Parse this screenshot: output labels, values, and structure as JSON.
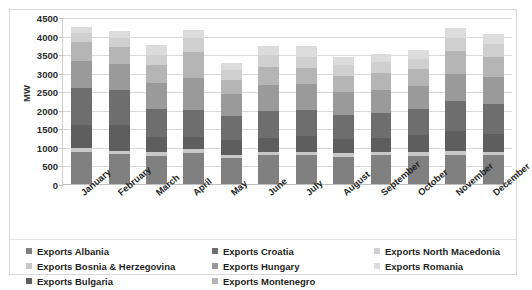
{
  "chart_data": {
    "type": "bar",
    "stacked": true,
    "title": "",
    "xlabel": "",
    "ylabel": "MW",
    "ylim": [
      0,
      4500
    ],
    "ytick_step": 500,
    "yticks": [
      0,
      500,
      1000,
      1500,
      2000,
      2500,
      3000,
      3500,
      4000,
      4500
    ],
    "grid": true,
    "legend_position": "bottom",
    "categories": [
      "January",
      "February",
      "March",
      "April",
      "May",
      "June",
      "July",
      "August",
      "September",
      "October",
      "November",
      "December"
    ],
    "series": [
      {
        "name": "Exports Albania",
        "color": "#808080",
        "values": [
          900,
          830,
          790,
          860,
          730,
          800,
          800,
          760,
          800,
          790,
          820,
          800
        ]
      },
      {
        "name": "Exports Bosnia & Herzegovina",
        "color": "#c8c8c8",
        "values": [
          110,
          100,
          95,
          105,
          90,
          100,
          100,
          95,
          100,
          100,
          105,
          100
        ]
      },
      {
        "name": "Exports Bulgaria",
        "color": "#5e5e5e",
        "values": [
          600,
          700,
          400,
          320,
          400,
          380,
          420,
          380,
          380,
          450,
          520,
          480
        ]
      },
      {
        "name": "Exports Croatia",
        "color": "#6e6e6e",
        "values": [
          1000,
          930,
          770,
          750,
          630,
          720,
          690,
          650,
          660,
          720,
          830,
          800
        ]
      },
      {
        "name": "Exports Hungary",
        "color": "#9a9a9a",
        "values": [
          740,
          700,
          690,
          840,
          590,
          690,
          700,
          620,
          630,
          610,
          730,
          720
        ]
      },
      {
        "name": "Exports Montenegro",
        "color": "#b5b5b5",
        "values": [
          500,
          450,
          480,
          700,
          400,
          500,
          450,
          430,
          440,
          450,
          600,
          550
        ]
      },
      {
        "name": "Exports North Macedonia",
        "color": "#cfcfcf",
        "values": [
          250,
          240,
          290,
          400,
          260,
          320,
          300,
          290,
          310,
          280,
          360,
          340
        ]
      },
      {
        "name": "Exports Romania",
        "color": "#dcdcdc",
        "values": [
          150,
          200,
          260,
          200,
          200,
          240,
          290,
          225,
          205,
          250,
          260,
          285
        ]
      }
    ],
    "totals": [
      4250,
      4150,
      3775,
      4175,
      3300,
      3750,
      3750,
      3450,
      3525,
      3650,
      4225,
      4075
    ],
    "colors": {
      "plot_background": "#ffffff",
      "gridline": "#d9d9d9",
      "frame_border": "#d9d9d9",
      "text": "#1f1f1f"
    }
  }
}
